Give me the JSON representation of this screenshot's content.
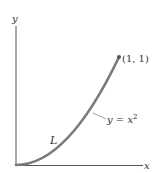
{
  "diagram": {
    "axes": {
      "x_label": "x",
      "y_label": "y"
    },
    "curve": {
      "equation_label_y": "y",
      "equation_label_eq": " = ",
      "equation_label_x": "x",
      "equation_label_exp": "2",
      "path_label": "L",
      "color": "#7a7a7a"
    },
    "endpoint": {
      "label": "(1, 1)"
    },
    "colors": {
      "axis": "#555555",
      "text": "#333333",
      "background": "#ffffff"
    }
  }
}
